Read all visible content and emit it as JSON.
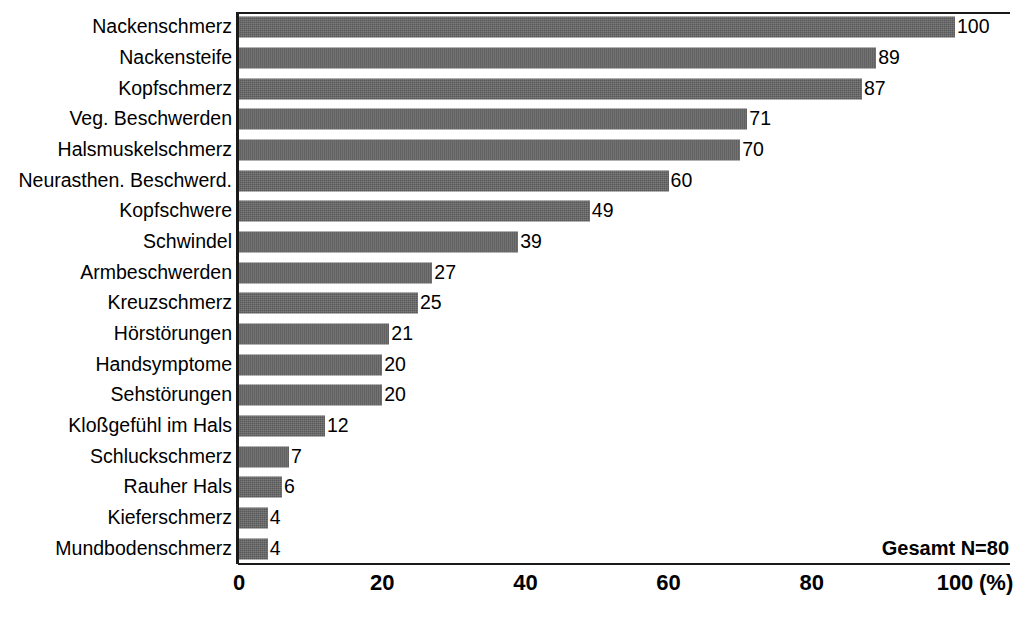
{
  "chart_data": {
    "type": "bar",
    "orientation": "horizontal",
    "title": "",
    "xlabel": "(%)",
    "ylabel": "",
    "xlim": [
      0,
      100
    ],
    "xticks": [
      0,
      20,
      40,
      60,
      80,
      100
    ],
    "xtick_labels": [
      "0",
      "20",
      "40",
      "60",
      "80",
      "100"
    ],
    "x_unit_label": "(%)",
    "grid": false,
    "legend": null,
    "annotation": "Gesamt N=80",
    "bar_color": "#585858",
    "axis_color": "#1a1a1a",
    "categories": [
      "Nackenschmerz",
      "Nackensteife",
      "Kopfschmerz",
      "Veg. Beschwerden",
      "Halsmuskelschmerz",
      "Neurasthen. Beschwerd.",
      "Kopfschwere",
      "Schwindel",
      "Armbeschwerden",
      "Kreuzschmerz",
      "Hörstörungen",
      "Handsymptome",
      "Sehstörungen",
      "Kloßgefühl im Hals",
      "Schluckschmerz",
      "Rauher Hals",
      "Kieferschmerz",
      "Mundbodenschmerz"
    ],
    "values": [
      100,
      89,
      87,
      71,
      70,
      60,
      49,
      39,
      27,
      25,
      21,
      20,
      20,
      12,
      7,
      6,
      4,
      4
    ],
    "value_labels": [
      "100",
      "89",
      "87",
      "71",
      "70",
      "60",
      "49",
      "39",
      "27",
      "25",
      "21",
      "20",
      "20",
      "12",
      "7",
      "6",
      "4",
      "4"
    ]
  }
}
